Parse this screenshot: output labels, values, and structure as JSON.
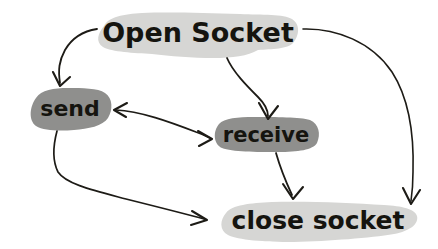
{
  "diagram": {
    "style": "hand-drawn sketch",
    "background_color": "#ffffff",
    "ink_color": "#1d1b16",
    "palette": {
      "light_node_fill": "#d6d6d4",
      "dark_node_fill": "#8f8f8d",
      "text_color": "#15140f"
    },
    "nodes": [
      {
        "id": "open-socket",
        "label": "Open Socket",
        "shape": "blob",
        "fill": "#d6d6d4",
        "text_color": "#15140f",
        "font_size": 27,
        "x": 95,
        "y": 13,
        "width": 205,
        "height": 45,
        "text_x": 198,
        "text_y": 33
      },
      {
        "id": "send",
        "label": "send",
        "shape": "rounded-blob",
        "fill": "#8f8f8d",
        "text_color": "#15140f",
        "font_size": 22,
        "x": 30,
        "y": 88,
        "width": 83,
        "height": 43,
        "text_x": 70,
        "text_y": 110
      },
      {
        "id": "receive",
        "label": "receive",
        "shape": "rounded-blob",
        "fill": "#8f8f8d",
        "text_color": "#15140f",
        "font_size": 21,
        "x": 213,
        "y": 117,
        "width": 107,
        "height": 36,
        "text_x": 266,
        "text_y": 136
      },
      {
        "id": "close-socket",
        "label": "close socket",
        "shape": "blob",
        "fill": "#d6d6d4",
        "text_color": "#15140f",
        "font_size": 25,
        "x": 218,
        "y": 202,
        "width": 200,
        "height": 41,
        "text_x": 318,
        "text_y": 222
      }
    ],
    "edges": [
      {
        "id": "edge-open-to-send",
        "from": "open-socket",
        "to": "send",
        "label": "",
        "direction": "one-way"
      },
      {
        "id": "edge-open-to-receive",
        "from": "open-socket",
        "to": "receive",
        "label": "",
        "direction": "one-way"
      },
      {
        "id": "edge-open-to-close",
        "from": "open-socket",
        "to": "close-socket",
        "label": "",
        "direction": "one-way"
      },
      {
        "id": "edge-send-to-receive",
        "from": "send",
        "to": "receive",
        "label": "",
        "direction": "bidirectional"
      },
      {
        "id": "edge-send-to-close",
        "from": "send",
        "to": "close-socket",
        "label": "",
        "direction": "one-way"
      },
      {
        "id": "edge-receive-to-close",
        "from": "receive",
        "to": "close-socket",
        "label": "",
        "direction": "one-way"
      }
    ]
  }
}
